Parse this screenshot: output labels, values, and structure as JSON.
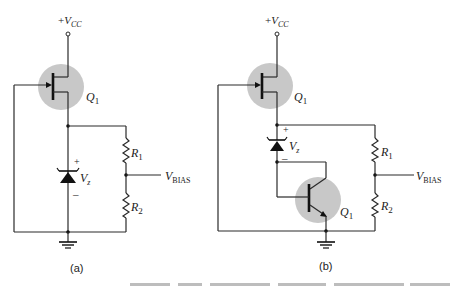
{
  "figure": {
    "panels": [
      {
        "id": "a",
        "label": "(a)",
        "supply": {
          "sign": "+",
          "v": "V",
          "sub": "CC"
        },
        "jfet": {
          "name": "Q",
          "sub": "1"
        },
        "zener": {
          "v": "V",
          "sub": "z",
          "plus": "+",
          "minus": "–"
        },
        "r1": {
          "name": "R",
          "sub": "1"
        },
        "r2": {
          "name": "R",
          "sub": "2"
        },
        "output": {
          "v": "V",
          "sub": "BIAS"
        }
      },
      {
        "id": "b",
        "label": "(b)",
        "supply": {
          "sign": "+",
          "v": "V",
          "sub": "CC"
        },
        "jfet": {
          "name": "Q",
          "sub": "1"
        },
        "bjt": {
          "name": "Q",
          "sub": "1"
        },
        "zener": {
          "v": "V",
          "sub": "z",
          "plus": "+",
          "minus": "–"
        },
        "r1": {
          "name": "R",
          "sub": "1"
        },
        "r2": {
          "name": "R",
          "sub": "2"
        },
        "output": {
          "v": "V",
          "sub": "BIAS"
        }
      }
    ],
    "colors": {
      "highlight": "#c8c8c8",
      "wire": "#2a2a2a"
    }
  }
}
